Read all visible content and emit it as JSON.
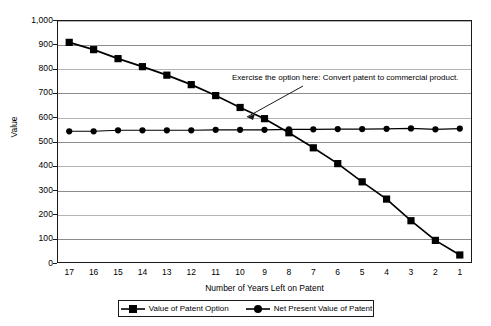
{
  "chart_data": {
    "type": "line",
    "title": "",
    "xlabel": "Number of Years Left on Patent",
    "ylabel": "Value",
    "x": [
      17,
      16,
      15,
      14,
      13,
      12,
      11,
      10,
      9,
      8,
      7,
      6,
      5,
      4,
      3,
      2,
      1
    ],
    "xtick_labels": [
      "17",
      "16",
      "15",
      "14",
      "13",
      "12",
      "11",
      "10",
      "9",
      "8",
      "7",
      "6",
      "5",
      "4",
      "3",
      "2",
      "1"
    ],
    "ytick_labels": [
      "1,000",
      "900",
      "800",
      "700",
      "600",
      "500",
      "400",
      "300",
      "200",
      "100",
      "0"
    ],
    "ytick_values": [
      1000,
      900,
      800,
      700,
      600,
      500,
      400,
      300,
      200,
      100,
      0
    ],
    "ylim": [
      0,
      1000
    ],
    "grid": true,
    "legend_position": "bottom",
    "series": [
      {
        "name": "Value of Patent Option",
        "marker": "square",
        "color": "#000000",
        "values": [
          908,
          878,
          841,
          808,
          773,
          734,
          689,
          640,
          594,
          536,
          474,
          409,
          334,
          263,
          174,
          93,
          33
        ]
      },
      {
        "name": "Net Present Value of Patent",
        "marker": "circle",
        "color": "#000000",
        "values": [
          542,
          542,
          546,
          546,
          546,
          546,
          548,
          548,
          548,
          550,
          550,
          551,
          551,
          552,
          554,
          550,
          553
        ]
      }
    ],
    "annotations": [
      {
        "text": "Exercise the option here: Convert patent to commercial product.",
        "points_to_x": 8,
        "points_to_y": 545
      }
    ]
  },
  "legend": {
    "items": [
      {
        "label": "Value of Patent Option",
        "marker": "square"
      },
      {
        "label": "Net Present Value of Patent",
        "marker": "circle"
      }
    ]
  }
}
